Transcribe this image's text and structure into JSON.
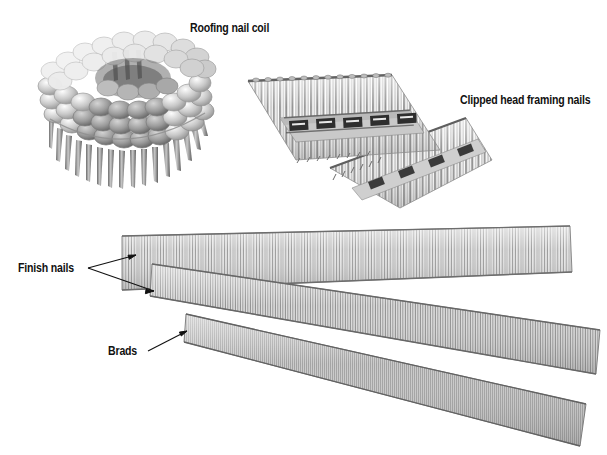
{
  "figure": {
    "background_color": "#ffffff",
    "width": 607,
    "height": 455,
    "ink_color": "#111111",
    "metal_light": "#f2f2f2",
    "metal_mid": "#9a9a9a",
    "metal_dark": "#4a4a4a"
  },
  "labels": {
    "roofing_nail_coil": "Roofing nail coil",
    "clipped_head_framing_nails": "Clipped head framing nails",
    "finish_nails": "Finish nails",
    "brads": "Brads"
  },
  "items": [
    {
      "key": "roofing-nail-coil",
      "label": "Roofing nail coil",
      "description": "Coil of roofing nails wound in a ring with wide flat heads and short shanks pointing down",
      "label_position": {
        "x": 190,
        "y": 22
      },
      "has_leader_line": false
    },
    {
      "key": "clipped-head-framing-nails",
      "label": "Clipped head framing nails",
      "description": "Two angled paper-collated strips of framing nails with clipped (D-shaped) heads and printed collation labels",
      "label_position": {
        "x": 460,
        "y": 94
      },
      "has_leader_line": false,
      "strip_count": 2,
      "collation_label_blocks": 5
    },
    {
      "key": "finish-nails",
      "label": "Finish nails",
      "description": "Two collated strips of slender finish nails",
      "label_position": {
        "x": 18,
        "y": 262
      },
      "has_leader_line": true,
      "leader_style": "forked-two-arrows"
    },
    {
      "key": "brads",
      "label": "Brads",
      "description": "Collated strip of thin brads, the smallest gauge shown",
      "label_position": {
        "x": 108,
        "y": 345
      },
      "has_leader_line": true,
      "leader_style": "single-arrow"
    }
  ],
  "leaders": {
    "finish_nails": {
      "fork_point": {
        "x": 88,
        "y": 268
      },
      "arrow_upper": {
        "x": 136,
        "y": 255
      },
      "arrow_lower": {
        "x": 154,
        "y": 291
      }
    },
    "brads": {
      "start": {
        "x": 148,
        "y": 351
      },
      "end": {
        "x": 187,
        "y": 331
      }
    }
  }
}
